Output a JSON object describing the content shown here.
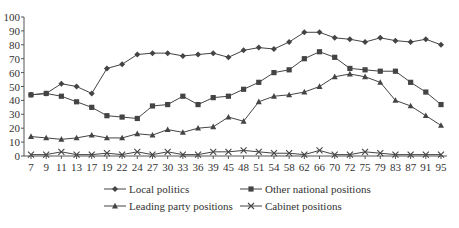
{
  "chart_data": {
    "type": "line",
    "title": "",
    "xlabel": "",
    "ylabel": "",
    "ylim": [
      0,
      100
    ],
    "yticks": [
      0,
      10,
      20,
      30,
      40,
      50,
      60,
      70,
      80,
      90,
      100
    ],
    "grid": false,
    "legend_position": "bottom",
    "categories": [
      "7",
      "9",
      "11",
      "13",
      "17",
      "19",
      "22",
      "24",
      "27",
      "30",
      "33",
      "36",
      "39",
      "45",
      "48",
      "51",
      "54",
      "58",
      "62",
      "66",
      "70",
      "72",
      "75",
      "79",
      "83",
      "87",
      "91",
      "95"
    ],
    "series": [
      {
        "name": "Local politics",
        "marker": "diamond",
        "values": [
          44,
          45,
          52,
          50,
          45,
          63,
          66,
          73,
          74,
          74,
          72,
          73,
          74,
          71,
          76,
          78,
          77,
          82,
          89,
          89,
          85,
          84,
          82,
          85,
          83,
          82,
          84,
          80
        ]
      },
      {
        "name": "Other national positions",
        "marker": "square",
        "values": [
          44,
          45,
          43,
          39,
          35,
          29,
          28,
          27,
          36,
          37,
          43,
          37,
          42,
          43,
          48,
          53,
          60,
          62,
          70,
          75,
          71,
          63,
          62,
          61,
          61,
          53,
          46,
          37
        ]
      },
      {
        "name": "Leading party positions",
        "marker": "triangle",
        "values": [
          14,
          13,
          12,
          13,
          15,
          13,
          13,
          16,
          15,
          19,
          17,
          20,
          21,
          28,
          25,
          39,
          43,
          44,
          46,
          50,
          57,
          59,
          57,
          53,
          40,
          36,
          29,
          22
        ]
      },
      {
        "name": "Cabinet positions",
        "marker": "x",
        "values": [
          1,
          1,
          3,
          1,
          1,
          2,
          1,
          3,
          1,
          3,
          1,
          1,
          3,
          3,
          4,
          3,
          2,
          2,
          1,
          4,
          1,
          1,
          3,
          2,
          1,
          1,
          1,
          1
        ]
      }
    ]
  },
  "colors": {
    "line": "#444444",
    "text": "#333333"
  }
}
